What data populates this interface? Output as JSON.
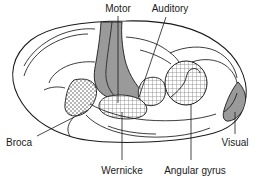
{
  "figure": {
    "background_color": "#ffffff",
    "outline_color": "#1a1a1a"
  },
  "labels": {
    "motor": "Motor",
    "auditory": "Auditory",
    "broca": "Broca",
    "wernicke": "Wernicke",
    "angular_gyrus": "Angular gyrus",
    "visual": "Visual"
  },
  "regions": [
    {
      "id": "motor",
      "label": "Motor",
      "fill_style": "solid-gray",
      "color": "#9a9a9a",
      "description": "Precentral motor strip running from vertex down toward the lateral sulcus"
    },
    {
      "id": "auditory",
      "label": "Auditory",
      "fill_style": "cross-hatch",
      "color": "#b8b8b8",
      "description": "Auditory cortex on the superior temporal plane"
    },
    {
      "id": "broca",
      "label": "Broca",
      "fill_style": "stipple",
      "color": "#8a8a8a",
      "description": "Broca's area in the inferior frontal gyrus"
    },
    {
      "id": "wernicke",
      "label": "Wernicke",
      "fill_style": "cross-hatch",
      "color": "#b8b8b8",
      "description": "Wernicke's area in the posterior superior temporal gyrus"
    },
    {
      "id": "angular_gyrus",
      "label": "Angular gyrus",
      "fill_style": "cross-hatch",
      "color": "#b8b8b8",
      "description": "Oval angular gyrus region in the parietal lobe"
    },
    {
      "id": "visual",
      "label": "Visual",
      "fill_style": "solid-gray",
      "color": "#9a9a9a",
      "description": "Visual cortex wedge at the occipital pole"
    }
  ]
}
